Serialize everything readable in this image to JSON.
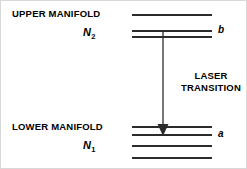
{
  "figure": {
    "title_alt": "Energy level diagram of a four-level laser showing upper and lower manifolds",
    "background_color": "#ffffff",
    "line_color": "#2b2b2b",
    "text_color": "#000000",
    "border_color": "#d8d8d8",
    "width": 247,
    "height": 169
  },
  "upper_manifold": {
    "label": "UPPER MANIFOLD",
    "population_symbol": "N",
    "population_subscript": "2",
    "state_label": "b",
    "level_count": 3,
    "levels": [
      {
        "y": 14,
        "x1": 132,
        "x2": 212,
        "is_state": false
      },
      {
        "y": 30,
        "x1": 132,
        "x2": 212,
        "is_state": true
      },
      {
        "y": 36,
        "x1": 132,
        "x2": 212,
        "is_state": false
      }
    ]
  },
  "lower_manifold": {
    "label": "LOWER MANIFOLD",
    "population_symbol": "N",
    "population_subscript": "1",
    "state_label": "a",
    "level_count": 4,
    "levels": [
      {
        "y": 126,
        "x1": 132,
        "x2": 212,
        "is_state": false
      },
      {
        "y": 134,
        "x1": 132,
        "x2": 212,
        "is_state": true
      },
      {
        "y": 145,
        "x1": 132,
        "x2": 212,
        "is_state": false
      },
      {
        "y": 157,
        "x1": 132,
        "x2": 212,
        "is_state": false
      }
    ]
  },
  "transition": {
    "label_line1": "LASER",
    "label_line2": "TRANSITION",
    "direction": "downward",
    "from_level": "b",
    "to_level": "a",
    "x": 163,
    "y_start": 31,
    "y_end": 136
  }
}
